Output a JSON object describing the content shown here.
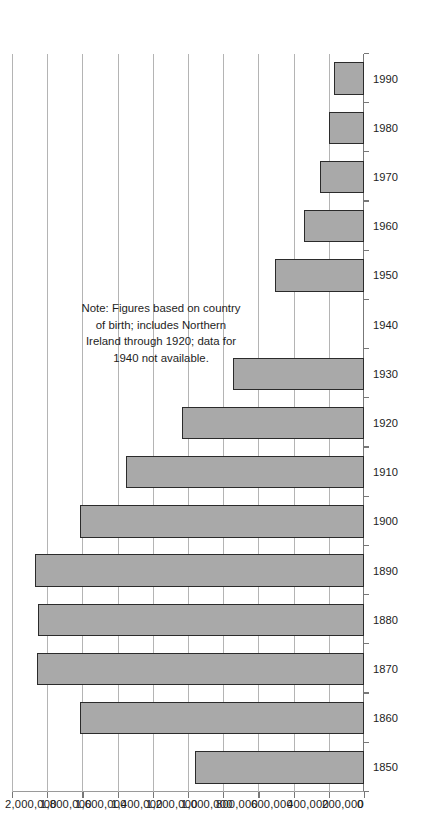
{
  "figure": {
    "orientation": "rotated-90-ccw",
    "background_color": "#ffffff",
    "bar_fill_color": "#a9a9a9",
    "bar_border_color": "#2b2b2b",
    "gridline_color": "#b4b4b4",
    "axis_color": "#777777"
  },
  "note": {
    "text": "Note: Figures based on country\nof birth; includes Northern\nIreland through 1920; data for\n1940 not available."
  },
  "chart_data": {
    "type": "bar",
    "title": "",
    "subtitle": "",
    "xlabel": "",
    "ylabel": "",
    "orientation": "vertical-bars-rendered-sideways",
    "categories": [
      "1850",
      "1860",
      "1870",
      "1880",
      "1890",
      "1900",
      "1910",
      "1920",
      "1930",
      "1940",
      "1950",
      "1960",
      "1970",
      "1980",
      "1990"
    ],
    "values": [
      961000,
      1611000,
      1856000,
      1855000,
      1872000,
      1615000,
      1352000,
      1037000,
      745000,
      null,
      505000,
      339000,
      251000,
      198000,
      170000
    ],
    "value_axis_ticks": [
      "0",
      "200,000",
      "400,000",
      "600,000",
      "800,000",
      "1,000,000",
      "1,200,000",
      "1,400,000",
      "1,600,000",
      "1,800,000",
      "2,000,000"
    ],
    "value_axis_tick_values": [
      0,
      200000,
      400000,
      600000,
      800000,
      1000000,
      1200000,
      1400000,
      1600000,
      1800000,
      2000000
    ],
    "ylim": [
      0,
      2000000
    ],
    "grid": true,
    "legend": false,
    "missing_categories": [
      "1940"
    ],
    "annotations": [
      "Note: Figures based on country of birth; includes Northern Ireland through 1920; data for 1940 not available."
    ]
  }
}
